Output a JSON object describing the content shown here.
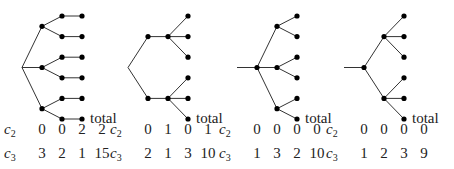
{
  "total_label": "total",
  "row_labels": [
    {
      "base": "c",
      "sub": "2"
    },
    {
      "base": "c",
      "sub": "3"
    }
  ],
  "trees": [
    {
      "name": "tree-1",
      "c2": [
        "0",
        "0",
        "2",
        "2"
      ],
      "c3": [
        "3",
        "2",
        "1",
        "15"
      ],
      "children_per_level": [
        3,
        2,
        1
      ]
    },
    {
      "name": "tree-2",
      "c2": [
        "0",
        "1",
        "0",
        "1"
      ],
      "c3": [
        "2",
        "1",
        "3",
        "10"
      ],
      "children_per_level": [
        2,
        1,
        3
      ]
    },
    {
      "name": "tree-3",
      "c2": [
        "0",
        "0",
        "0",
        "0"
      ],
      "c3": [
        "1",
        "3",
        "2",
        "10"
      ],
      "children_per_level": [
        1,
        3,
        2
      ]
    },
    {
      "name": "tree-4",
      "c2": [
        "0",
        "0",
        "0",
        "0"
      ],
      "c3": [
        "1",
        "2",
        "3",
        "9"
      ],
      "children_per_level": [
        1,
        2,
        3
      ]
    }
  ]
}
